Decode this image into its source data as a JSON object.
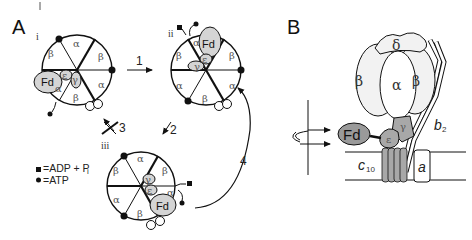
{
  "figure": {
    "panels": [
      {
        "id": "A",
        "label": "A"
      },
      {
        "id": "B",
        "label": "B"
      }
    ],
    "panel_a": {
      "states": [
        {
          "id": "i",
          "label": "i"
        },
        {
          "id": "ii",
          "label": "ii"
        },
        {
          "id": "iii",
          "label": "iii"
        }
      ],
      "steps": [
        {
          "id": "1",
          "label": "1"
        },
        {
          "id": "2",
          "label": "2"
        },
        {
          "id": "3",
          "label": "3"
        },
        {
          "id": "4",
          "label": "4"
        }
      ],
      "subunits": {
        "alpha": "α",
        "beta": "β",
        "gamma": "γ",
        "epsilon": "ε",
        "delta": "δ",
        "fd": "Fd",
        "b": "b"
      },
      "legend": [
        {
          "symbol": "square",
          "text": "=ADP + P",
          "subscript": "i"
        },
        {
          "symbol": "circle",
          "text": "=ATP"
        }
      ]
    },
    "panel_b": {
      "labels": {
        "delta": "δ",
        "alpha": "α",
        "beta_left": "β",
        "beta_right": "β",
        "gamma": "γ",
        "epsilon": "ε",
        "fd": "Fd",
        "b": "b",
        "b_sub": "2",
        "c": "c",
        "c_sub": "10",
        "a": "a"
      }
    },
    "colors": {
      "line": "#111111",
      "fd_fill": "#d4d4d4",
      "fd_fill_dark": "#9a9a9a",
      "stalk_fill": "#a8a8a8",
      "head_fill": "#f2f2f2",
      "background": "#ffffff"
    }
  }
}
